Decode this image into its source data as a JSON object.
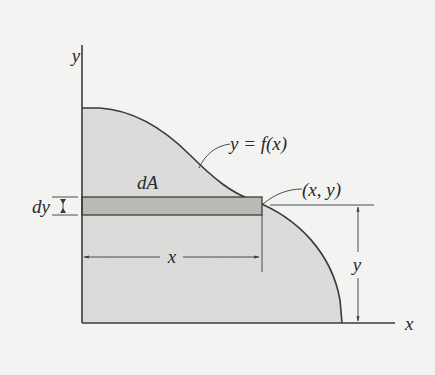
{
  "diagram": {
    "type": "area-element-diagram",
    "colors": {
      "background": "#f3f3f1",
      "region_fill": "#dcdcda",
      "strip_fill": "#b9b9b6",
      "line": "#3a3a3a"
    },
    "axes": {
      "y_label": "y",
      "x_label": "x"
    },
    "labels": {
      "curve": "y = f(x)",
      "point": "(x, y)",
      "element": "dA",
      "strip_thickness": "dy",
      "x_dimension": "x",
      "y_dimension": "y"
    }
  }
}
